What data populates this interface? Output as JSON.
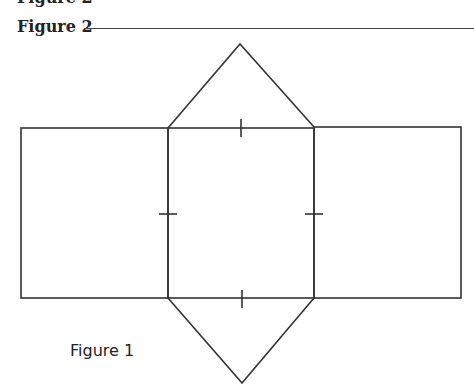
{
  "header": {
    "cut_text": "Figure 2",
    "heading": "Figure 2"
  },
  "diagram": {
    "type": "triangular-prism-net",
    "shapes": [
      {
        "name": "left-rectangle",
        "kind": "rect"
      },
      {
        "name": "center-square",
        "kind": "rect"
      },
      {
        "name": "right-rectangle",
        "kind": "rect"
      },
      {
        "name": "top-triangle",
        "kind": "triangle"
      },
      {
        "name": "bottom-triangle",
        "kind": "triangle"
      }
    ],
    "congruence_ticks": [
      "top",
      "bottom",
      "left",
      "right"
    ],
    "stroke_color": "#333333"
  },
  "caption": {
    "label": "Figure 1"
  }
}
